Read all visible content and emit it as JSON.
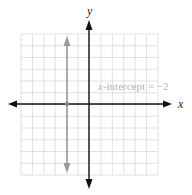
{
  "chart_data": {
    "type": "line",
    "title": "",
    "xlabel": "x",
    "ylabel": "y",
    "xlim": [
      -6,
      6
    ],
    "ylim": [
      -6,
      6
    ],
    "grid": true,
    "series": [
      {
        "name": "x = -2",
        "type": "vertical-line",
        "x": -2,
        "color": "#9a9a9a"
      }
    ],
    "points": [
      {
        "x": -2,
        "y": 0,
        "label": "x-intercept"
      }
    ],
    "annotations": [
      {
        "text": "x-intercept = −2",
        "x": 0.3,
        "y": 1.2
      }
    ]
  },
  "labels": {
    "x_axis": "x",
    "y_axis": "y",
    "annotation_var": "x",
    "annotation_rest": "-intercept = −2"
  },
  "colors": {
    "grid": "#d9d9d9",
    "axis": "#111111",
    "line": "#9a9a9a",
    "annotation": "#b5b5b5"
  }
}
